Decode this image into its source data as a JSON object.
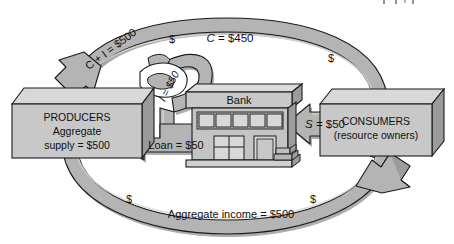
{
  "diagram": {
    "type": "circular-flow-diagram",
    "colors": {
      "arrow_face": "#b4b4b4",
      "arrow_shade": "#8c8c8c",
      "arrow_highlight": "#d2d2d2",
      "box_face": "#c8c8c8",
      "box_top": "#d8d8d8",
      "box_side": "#9a9a9a",
      "bank_face": "#c0c0c0",
      "bank_window": "#d6d6d6",
      "outline": "#1a1a1a",
      "text": "#101010",
      "background": "#ffffff"
    }
  },
  "producers": {
    "line1": "PRODUCERS",
    "line2": "Aggregate",
    "line3": "supply  =  $500"
  },
  "consumers": {
    "line1": "CONSUMERS",
    "line2": "(resource owners)"
  },
  "bank": {
    "label": "Bank"
  },
  "flows": {
    "upper_arc_left_label": "C + I  =  $500",
    "upper_arc_right_label": "C  =  $450",
    "upper_arc_right_label_italic": "C",
    "upper_arc_right_label_rest": "  =  $450",
    "investment_label": "I  =  $50",
    "loan_label": "Loan  =  $50",
    "savings_label_italic": "S",
    "savings_label_rest": "  =  $50",
    "savings_label_full": "S  =  $50",
    "lower_arc_label": "Aggregate income  =  $500"
  },
  "currency_marks": {
    "upper_left": "$",
    "upper_right": "$",
    "lower_left": "$",
    "lower_right": "$"
  }
}
